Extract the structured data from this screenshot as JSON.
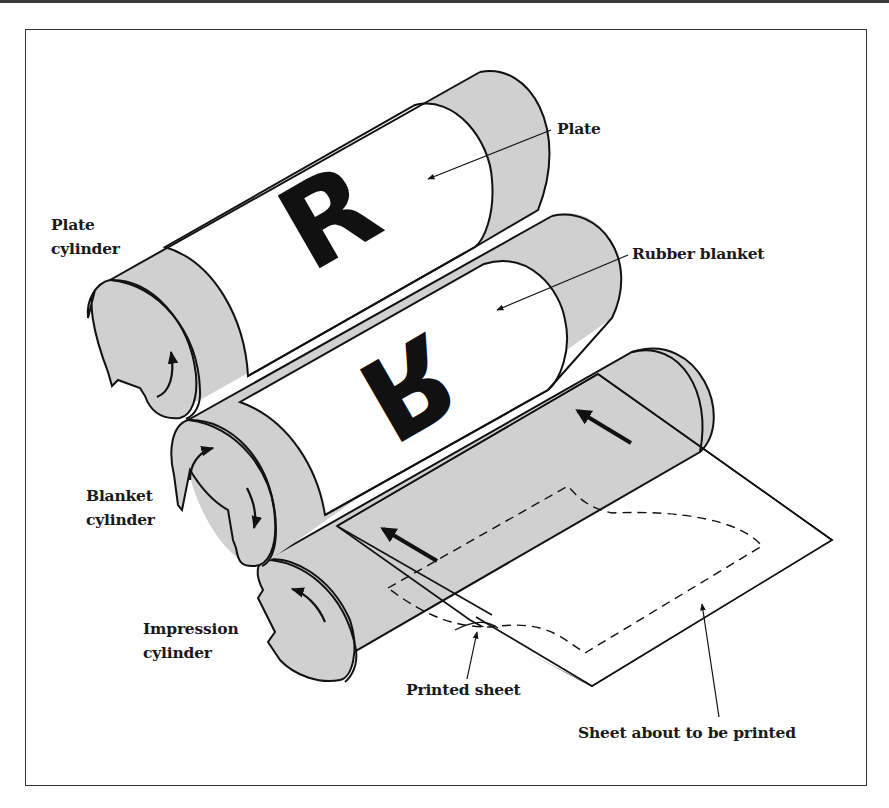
{
  "figure": {
    "letter_on_plate": "R",
    "letter_on_blanket": "R",
    "colors": {
      "cylinder_gray": "#d0d0d0",
      "band_white": "#ffffff",
      "ink_black": "#111111",
      "frame_line": "#333333"
    }
  },
  "labels": {
    "plate_cylinder": {
      "line1": "Plate",
      "line2": "cylinder"
    },
    "blanket_cylinder": {
      "line1": "Blanket",
      "line2": "cylinder"
    },
    "impression_cylinder": {
      "line1": "Impression",
      "line2": "cylinder"
    },
    "plate": "Plate",
    "rubber_blanket": "Rubber blanket",
    "printed_sheet": "Printed sheet",
    "sheet_about_to_be_printed": "Sheet about to be printed"
  },
  "arrows": [
    {
      "name": "plate-rotation-arrow",
      "direction": "counterclockwise"
    },
    {
      "name": "blanket-rotation-arrow-upper",
      "direction": "clockwise"
    },
    {
      "name": "blanket-rotation-arrow-lower",
      "direction": "clockwise"
    },
    {
      "name": "impression-rotation-arrow",
      "direction": "counterclockwise"
    },
    {
      "name": "sheet-feed-arrow-left",
      "direction": "up-left"
    },
    {
      "name": "sheet-feed-arrow-right",
      "direction": "up-left"
    }
  ]
}
